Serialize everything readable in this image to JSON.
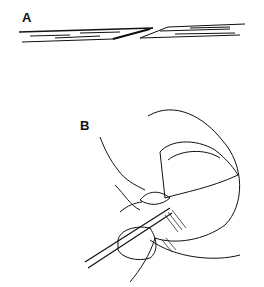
{
  "figure": {
    "panels": [
      {
        "label": "A",
        "description": "Cross-section of a tissue strip cut obliquely, showing a beveled gap between two overlapping ends"
      },
      {
        "label": "B",
        "description": "Line drawing of a fingertip with nail; a thin instrument lifts a small flap of tissue at the nail fold"
      }
    ]
  }
}
